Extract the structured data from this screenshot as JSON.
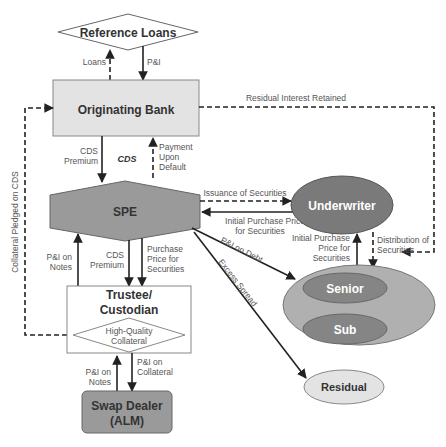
{
  "nodes": {
    "reference_loans": "Reference Loans",
    "originating_bank": "Originating Bank",
    "spe": "SPE",
    "trustee_line1": "Trustee/",
    "trustee_line2": "Custodian",
    "collateral_line1": "High-Quality",
    "collateral_line2": "Collateral",
    "swap_line1": "Swap Dealer",
    "swap_line2": "(ALM)",
    "underwriter": "Underwriter",
    "senior": "Senior",
    "sub": "Sub",
    "residual": "Residual"
  },
  "flows": {
    "loans": "Loans",
    "pi": "P&I",
    "residual_interest": "Residual Interest Retained",
    "cds_premium_1": "CDS",
    "cds_premium_2": "Premium",
    "cds_center": "CDS",
    "payment_1": "Payment",
    "payment_2": "Upon",
    "payment_3": "Default",
    "collateral_pledged": "Collateral Pledged on CDS",
    "issuance": "Issuance of Securities",
    "initial_purchase_1": "Initial Purchase Price",
    "initial_purchase_2": "for Securities",
    "pi_on_debt": "P&I on Debt",
    "excess_spread": "Excess Spread",
    "uw_initial_1": "Initial Purchase",
    "uw_initial_2": "Price for",
    "uw_initial_3": "Securities",
    "distribution_1": "Distribution of",
    "distribution_2": "Securities",
    "pi_notes_1": "P&I on",
    "pi_notes_2": "Notes",
    "trustee_cds_1": "CDS",
    "trustee_cds_2": "Premium",
    "purchase_1": "Purchase",
    "purchase_2": "Price for",
    "purchase_3": "Securities",
    "swap_pi_notes_1": "P&I on",
    "swap_pi_notes_2": "Notes",
    "swap_pi_coll_1": "P&I on",
    "swap_pi_coll_2": "Collateral"
  },
  "colors": {
    "light_gray": "#e3e3e3",
    "mid_gray": "#9a9a9a",
    "dark_gray": "#7a7a7a",
    "ellipse_outer": "#b0b0b0",
    "ellipse_inner": "#858585",
    "line": "#222222"
  }
}
